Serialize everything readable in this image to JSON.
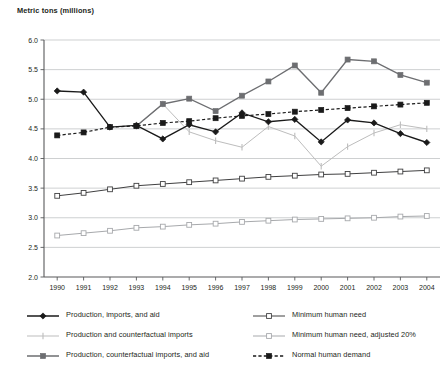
{
  "chart_data": {
    "type": "line",
    "title": "Metric tons (millions)",
    "xlabel": "",
    "ylabel": "Metric tons (millions)",
    "grid": true,
    "legend_position": "bottom",
    "ylim": [
      2.0,
      6.0
    ],
    "yticks": [
      "2.0",
      "2.5",
      "3.0",
      "3.5",
      "4.0",
      "4.5",
      "5.0",
      "5.5",
      "6.0"
    ],
    "categories": [
      "1990",
      "1991",
      "1992",
      "1993",
      "1994",
      "1995",
      "1996",
      "1997",
      "1998",
      "1999",
      "2000",
      "2001",
      "2002",
      "2003",
      "2004"
    ],
    "series": [
      {
        "name": "Production, imports, and aid",
        "color": "#1a1a1a",
        "marker": "diamond-filled",
        "dash": "solid",
        "values": [
          5.14,
          5.12,
          4.53,
          4.56,
          4.33,
          4.57,
          4.45,
          4.77,
          4.62,
          4.66,
          4.28,
          4.65,
          4.6,
          4.42,
          4.27
        ]
      },
      {
        "name": "Production and counterfactual imports",
        "color": "#bdbdbd",
        "marker": "plus",
        "dash": "solid",
        "values": [
          null,
          null,
          null,
          4.54,
          4.92,
          4.45,
          4.3,
          4.19,
          4.54,
          4.38,
          3.87,
          4.2,
          4.43,
          4.57,
          4.5
        ]
      },
      {
        "name": "Production, counterfactual imports, and aid",
        "color": "#6d6e71",
        "marker": "square-filled",
        "dash": "solid",
        "values": [
          null,
          null,
          null,
          4.55,
          4.92,
          5.01,
          4.8,
          5.06,
          5.3,
          5.57,
          5.11,
          5.67,
          5.64,
          5.41,
          5.28
        ]
      },
      {
        "name": "Minimum human need",
        "color": "#404041",
        "marker": "square-open",
        "dash": "solid",
        "values": [
          3.37,
          3.42,
          3.48,
          3.54,
          3.57,
          3.6,
          3.63,
          3.66,
          3.69,
          3.71,
          3.73,
          3.74,
          3.76,
          3.78,
          3.8
        ]
      },
      {
        "name": "Minimum human need, adjusted 20%",
        "color": "#a7a9ac",
        "marker": "square-open",
        "dash": "solid",
        "values": [
          2.7,
          2.74,
          2.78,
          2.83,
          2.85,
          2.88,
          2.9,
          2.93,
          2.95,
          2.97,
          2.98,
          2.99,
          3.0,
          3.02,
          3.03
        ]
      },
      {
        "name": "Normal human demand",
        "color": "#1a1a1a",
        "marker": "square-filled",
        "dash": "dashed",
        "values": [
          4.39,
          4.44,
          4.53,
          4.55,
          4.6,
          4.63,
          4.68,
          4.72,
          4.75,
          4.79,
          4.82,
          4.85,
          4.88,
          4.91,
          4.94
        ]
      }
    ]
  },
  "legend": {
    "left_column": [
      {
        "label": "Production, imports, and aid",
        "series": 0
      },
      {
        "label": "Production and counterfactual imports",
        "series": 1
      },
      {
        "label": "Production, counterfactual imports, and aid",
        "series": 2
      }
    ],
    "right_column": [
      {
        "label": "Minimum human need",
        "series": 3
      },
      {
        "label": "Minimum human need, adjusted 20%",
        "series": 4
      },
      {
        "label": "Normal human demand",
        "series": 5
      }
    ]
  }
}
